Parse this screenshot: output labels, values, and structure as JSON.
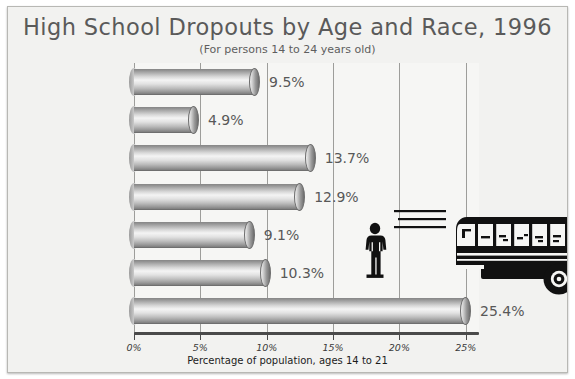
{
  "chart_data": {
    "type": "bar",
    "orientation": "horizontal",
    "title": "High School Dropouts by Age and Race, 1996",
    "subtitle": "(For persons 14 to 24 years old)",
    "xlabel": "Percentage of population, ages 14 to 21",
    "ylabel": "",
    "categories": [
      "Total dropouts",
      "16 to 17 years",
      "18 to 21 years",
      "22 to 24 years",
      "White",
      "Black",
      "Hispanic"
    ],
    "values": [
      9.5,
      4.9,
      13.7,
      12.9,
      9.1,
      10.3,
      25.4
    ],
    "value_labels": [
      "9.5%",
      "4.9%",
      "13.7%",
      "12.9%",
      "9.1%",
      "10.3%",
      "25.4%"
    ],
    "xlim": [
      0,
      26
    ],
    "xticks": [
      0,
      5,
      10,
      15,
      20,
      25
    ],
    "xtick_labels": [
      "0%",
      "5%",
      "10%",
      "15%",
      "20%",
      "25%"
    ],
    "grid": true,
    "legend": "none",
    "bar_style": "3d-cylinder",
    "colors": {
      "background": "#f2f2f0",
      "plot_background": "#f6f6f4",
      "bar_light": "#f4f4f4",
      "bar_mid": "#bdbdbd",
      "bar_dark": "#7e7e7e",
      "gridline": "#9d9d9a",
      "axis": "#4a4a4a",
      "title_text": "#5a5a5a",
      "value_text": "#585858",
      "label_text": "#1c1c1c",
      "artwork": "#111111"
    },
    "annotations": [
      {
        "name": "school-bus-illustration",
        "description": "black silhouette of a school bus with speed lines"
      },
      {
        "name": "person-silhouette",
        "description": "black silhouette of a standing person with hands on hips"
      }
    ]
  }
}
